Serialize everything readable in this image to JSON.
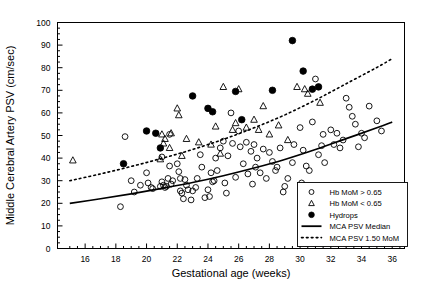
{
  "chart_data": {
    "type": "scatter",
    "title": "",
    "xlabel": "Gestational age (weeks)",
    "ylabel": "Middle Cerebral Artery PSV (cm/sec)",
    "xlim": [
      14.2,
      36.8
    ],
    "ylim": [
      0,
      100
    ],
    "xticks": [
      16,
      18,
      20,
      22,
      24,
      26,
      28,
      30,
      32,
      34,
      36
    ],
    "yticks": [
      0,
      10,
      20,
      30,
      40,
      50,
      60,
      70,
      80,
      90,
      100
    ],
    "xminor_step": 0.5,
    "yminor_step": 2.5,
    "grid": false,
    "legend_position": "bottom-right",
    "series": [
      {
        "name": "Hb MoM > 0.65",
        "marker": "open-circle",
        "points": [
          [
            18.3,
            18.5
          ],
          [
            19.0,
            30.0
          ],
          [
            19.2,
            25.0
          ],
          [
            18.6,
            49.5
          ],
          [
            19.6,
            28.0
          ],
          [
            20.0,
            33.5
          ],
          [
            20.1,
            29.0
          ],
          [
            20.3,
            27.0
          ],
          [
            20.4,
            26.5
          ],
          [
            20.9,
            27.5
          ],
          [
            21.0,
            40.5
          ],
          [
            21.0,
            29.5
          ],
          [
            21.1,
            28.0
          ],
          [
            21.2,
            27.0
          ],
          [
            21.3,
            27.5
          ],
          [
            21.4,
            31.0
          ],
          [
            21.5,
            36.5
          ],
          [
            21.5,
            50.5
          ],
          [
            21.6,
            28.5
          ],
          [
            21.7,
            30.0
          ],
          [
            22.0,
            37.5
          ],
          [
            22.1,
            34.0
          ],
          [
            22.2,
            31.0
          ],
          [
            22.2,
            25.5
          ],
          [
            22.3,
            24.5
          ],
          [
            22.4,
            22.0
          ],
          [
            22.5,
            30.5
          ],
          [
            22.6,
            28.0
          ],
          [
            22.7,
            26.0
          ],
          [
            23.0,
            25.5
          ],
          [
            23.2,
            27.0
          ],
          [
            23.3,
            31.0
          ],
          [
            23.5,
            41.5
          ],
          [
            23.6,
            36.0
          ],
          [
            24.0,
            26.0
          ],
          [
            24.1,
            23.0
          ],
          [
            24.2,
            33.5
          ],
          [
            24.3,
            29.5
          ],
          [
            24.5,
            40.0
          ],
          [
            24.6,
            34.5
          ],
          [
            24.8,
            44.5
          ],
          [
            25.0,
            47.5
          ],
          [
            25.1,
            29.0
          ],
          [
            25.3,
            41.0
          ],
          [
            25.5,
            60.0
          ],
          [
            25.6,
            46.5
          ],
          [
            25.8,
            31.5
          ],
          [
            26.0,
            52.0
          ],
          [
            26.1,
            45.0
          ],
          [
            26.3,
            37.5
          ],
          [
            26.5,
            47.0
          ],
          [
            26.6,
            33.0
          ],
          [
            26.8,
            43.0
          ],
          [
            27.0,
            46.0
          ],
          [
            27.1,
            36.0
          ],
          [
            27.2,
            40.0
          ],
          [
            27.4,
            33.5
          ],
          [
            27.6,
            44.0
          ],
          [
            27.8,
            31.0
          ],
          [
            28.0,
            42.5
          ],
          [
            28.2,
            38.5
          ],
          [
            28.4,
            34.5
          ],
          [
            28.5,
            36.0
          ],
          [
            28.7,
            44.5
          ],
          [
            29.0,
            27.5
          ],
          [
            29.2,
            31.0
          ],
          [
            29.5,
            38.0
          ],
          [
            29.6,
            46.0
          ],
          [
            30.0,
            53.5
          ],
          [
            30.2,
            43.5
          ],
          [
            30.4,
            36.5
          ],
          [
            30.6,
            34.5
          ],
          [
            30.8,
            56.0
          ],
          [
            31.0,
            75.0
          ],
          [
            31.2,
            41.5
          ],
          [
            31.4,
            45.5
          ],
          [
            31.5,
            50.5
          ],
          [
            31.6,
            38.0
          ],
          [
            32.0,
            52.5
          ],
          [
            32.2,
            46.0
          ],
          [
            32.4,
            51.0
          ],
          [
            32.6,
            44.5
          ],
          [
            32.8,
            48.0
          ],
          [
            33.0,
            66.5
          ],
          [
            33.2,
            62.5
          ],
          [
            33.4,
            58.5
          ],
          [
            33.6,
            55.0
          ],
          [
            34.0,
            51.0
          ],
          [
            34.2,
            49.0
          ],
          [
            34.5,
            63.0
          ],
          [
            35.0,
            56.5
          ],
          [
            35.3,
            52.0
          ],
          [
            22.9,
            21.5
          ],
          [
            23.8,
            22.5
          ],
          [
            25.2,
            24.5
          ],
          [
            28.9,
            25.0
          ],
          [
            30.1,
            29.0
          ],
          [
            33.8,
            45.0
          ],
          [
            24.4,
            30.0
          ],
          [
            26.9,
            28.5
          ]
        ]
      },
      {
        "name": "Hb MoM < 0.65",
        "marker": "open-triangle",
        "points": [
          [
            15.2,
            39.0
          ],
          [
            20.9,
            39.5
          ],
          [
            21.0,
            50.5
          ],
          [
            21.1,
            46.5
          ],
          [
            21.2,
            48.5
          ],
          [
            21.5,
            44.5
          ],
          [
            21.6,
            51.0
          ],
          [
            22.0,
            62.0
          ],
          [
            22.1,
            59.0
          ],
          [
            22.6,
            48.5
          ],
          [
            23.4,
            47.0
          ],
          [
            24.2,
            46.0
          ],
          [
            24.5,
            54.0
          ],
          [
            25.0,
            71.5
          ],
          [
            25.6,
            52.5
          ],
          [
            25.8,
            55.5
          ],
          [
            26.0,
            70.5
          ],
          [
            26.5,
            53.5
          ],
          [
            27.0,
            57.0
          ],
          [
            27.3,
            52.5
          ],
          [
            27.6,
            63.0
          ],
          [
            28.0,
            50.5
          ],
          [
            28.6,
            54.5
          ],
          [
            29.2,
            48.0
          ],
          [
            30.3,
            70.5
          ],
          [
            30.5,
            68.5
          ],
          [
            31.3,
            64.5
          ],
          [
            22.3,
            41.0
          ],
          [
            24.8,
            42.0
          ],
          [
            29.8,
            71.5
          ]
        ]
      },
      {
        "name": "Hydrops",
        "marker": "filled-circle",
        "points": [
          [
            18.5,
            37.5
          ],
          [
            20.0,
            52.0
          ],
          [
            20.6,
            51.0
          ],
          [
            20.9,
            44.5
          ],
          [
            23.0,
            67.5
          ],
          [
            24.0,
            62.0
          ],
          [
            24.3,
            60.5
          ],
          [
            25.8,
            69.5
          ],
          [
            26.2,
            57.0
          ],
          [
            28.2,
            70.0
          ],
          [
            29.5,
            92.0
          ],
          [
            30.2,
            78.5
          ],
          [
            30.8,
            70.5
          ],
          [
            31.2,
            71.5
          ]
        ]
      }
    ],
    "curves": [
      {
        "name": "MCA PSV Median",
        "style": "solid",
        "x": [
          15,
          17,
          19,
          21,
          23,
          25,
          27,
          29,
          31,
          33,
          35,
          36
        ],
        "y": [
          20.0,
          22.0,
          24.2,
          26.6,
          29.2,
          32.2,
          35.6,
          39.4,
          43.8,
          48.6,
          53.4,
          56.0
        ]
      },
      {
        "name": "MCA PSV 1.50 MoM",
        "style": "dotted",
        "x": [
          15,
          17,
          19,
          21,
          23,
          25,
          27,
          29,
          31,
          33,
          35,
          36
        ],
        "y": [
          30.0,
          33.0,
          36.3,
          39.9,
          43.8,
          48.3,
          53.4,
          59.1,
          65.7,
          72.9,
          80.1,
          84.0
        ]
      }
    ],
    "legend_entries": [
      {
        "label": "Hb MoM > 0.65",
        "marker": "open-circle"
      },
      {
        "label": "Hb MoM < 0.65",
        "marker": "open-triangle"
      },
      {
        "label": "Hydrops",
        "marker": "filled-circle"
      },
      {
        "label": "MCA PSV Median",
        "marker": "solid-line"
      },
      {
        "label": "MCA PSV 1.50 MoM",
        "marker": "dotted-line"
      }
    ],
    "colors": {
      "ink": "#000000",
      "background": "#ffffff"
    }
  }
}
